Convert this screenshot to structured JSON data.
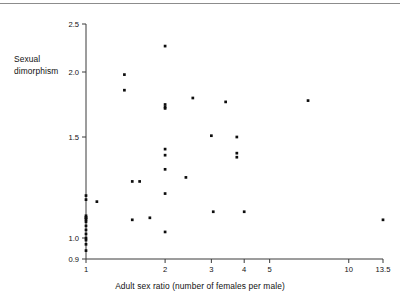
{
  "figure": {
    "ylabel_line1": "Sexual",
    "ylabel_line2": "dimorphism",
    "xlabel": "Adult sex ratio (number of females per male)",
    "divider_color": "#8c8c8c",
    "axis_color": "#3a3a3a",
    "marker_color": "#0d0d0d"
  },
  "chart_data": {
    "type": "scatter",
    "title": "",
    "xlabel": "Adult sex ratio (number of females per male)",
    "ylabel": "Sexual dimorphism",
    "xscale": "log",
    "xlim": [
      1,
      13.5
    ],
    "ylim": [
      0.9,
      2.5
    ],
    "xticks": [
      1,
      2,
      3,
      4,
      5,
      10,
      13.5
    ],
    "xticklabels": [
      "1",
      "2",
      "3",
      "4",
      "5",
      "10",
      "13.5"
    ],
    "yticks": [
      0.9,
      1.0,
      1.5,
      2.0,
      2.5
    ],
    "yticklabels": [
      "0.9",
      "1.0",
      "1.5",
      "2.0",
      "2.5"
    ],
    "grid": false,
    "legend": false,
    "marker": "filled-square",
    "points": [
      {
        "x": 1.0,
        "y": 1.21
      },
      {
        "x": 1.0,
        "y": 1.19
      },
      {
        "x": 1.0,
        "y": 1.11
      },
      {
        "x": 1.0,
        "y": 1.1
      },
      {
        "x": 1.0,
        "y": 1.1
      },
      {
        "x": 1.0,
        "y": 1.09
      },
      {
        "x": 1.0,
        "y": 1.08
      },
      {
        "x": 1.0,
        "y": 1.06
      },
      {
        "x": 1.0,
        "y": 1.04
      },
      {
        "x": 1.0,
        "y": 1.02
      },
      {
        "x": 1.0,
        "y": 1.0
      },
      {
        "x": 1.0,
        "y": 0.99
      },
      {
        "x": 1.0,
        "y": 0.97
      },
      {
        "x": 1.0,
        "y": 0.94
      },
      {
        "x": 1.1,
        "y": 1.18
      },
      {
        "x": 1.4,
        "y": 1.98
      },
      {
        "x": 1.4,
        "y": 1.86
      },
      {
        "x": 1.5,
        "y": 1.28
      },
      {
        "x": 1.5,
        "y": 1.09
      },
      {
        "x": 1.6,
        "y": 1.28
      },
      {
        "x": 1.75,
        "y": 1.1
      },
      {
        "x": 2.0,
        "y": 2.27
      },
      {
        "x": 2.0,
        "y": 1.75
      },
      {
        "x": 2.0,
        "y": 1.73
      },
      {
        "x": 2.0,
        "y": 1.72
      },
      {
        "x": 2.0,
        "y": 1.44
      },
      {
        "x": 2.0,
        "y": 1.41
      },
      {
        "x": 2.0,
        "y": 1.34
      },
      {
        "x": 2.0,
        "y": 1.22
      },
      {
        "x": 2.0,
        "y": 1.03
      },
      {
        "x": 2.4,
        "y": 1.3
      },
      {
        "x": 2.55,
        "y": 1.8
      },
      {
        "x": 3.0,
        "y": 1.51
      },
      {
        "x": 3.05,
        "y": 1.13
      },
      {
        "x": 3.4,
        "y": 1.77
      },
      {
        "x": 3.75,
        "y": 1.5
      },
      {
        "x": 3.75,
        "y": 1.42
      },
      {
        "x": 3.75,
        "y": 1.4
      },
      {
        "x": 4.0,
        "y": 1.13
      },
      {
        "x": 7.0,
        "y": 1.78
      },
      {
        "x": 13.5,
        "y": 1.09
      }
    ]
  }
}
